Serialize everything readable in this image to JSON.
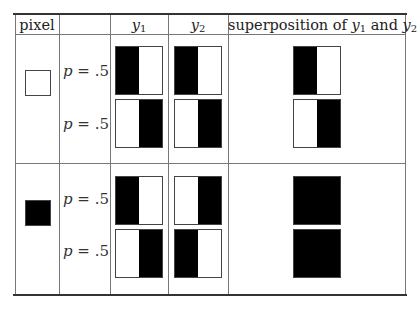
{
  "caption_partial": "",
  "table": {
    "headers": {
      "pixel": "pixel",
      "blank": "",
      "y1": {
        "var": "y",
        "sub": "1"
      },
      "y2": {
        "var": "y",
        "sub": "2"
      },
      "superposition": {
        "prefix": "superposition of ",
        "var1": "y",
        "sub1": "1",
        "mid": " and ",
        "var2": "y",
        "sub2": "2"
      }
    },
    "rows": [
      {
        "pixel": "white",
        "cases": [
          {
            "p_label": "p = ",
            "p_value": ".5",
            "y1": [
              "black",
              "white"
            ],
            "y2": [
              "black",
              "white"
            ],
            "superposition": [
              "black",
              "white"
            ]
          },
          {
            "p_label": "p = ",
            "p_value": ".5",
            "y1": [
              "white",
              "black"
            ],
            "y2": [
              "white",
              "black"
            ],
            "superposition": [
              "white",
              "black"
            ]
          }
        ]
      },
      {
        "pixel": "black",
        "cases": [
          {
            "p_label": "p = ",
            "p_value": ".5",
            "y1": [
              "black",
              "white"
            ],
            "y2": [
              "white",
              "black"
            ],
            "superposition": [
              "black",
              "black"
            ]
          },
          {
            "p_label": "p = ",
            "p_value": ".5",
            "y1": [
              "white",
              "black"
            ],
            "y2": [
              "black",
              "white"
            ],
            "superposition": [
              "black",
              "black"
            ]
          }
        ]
      }
    ]
  },
  "colors": {
    "black": "#000000",
    "white": "#ffffff",
    "rule": "#333333",
    "grid": "#777777"
  }
}
